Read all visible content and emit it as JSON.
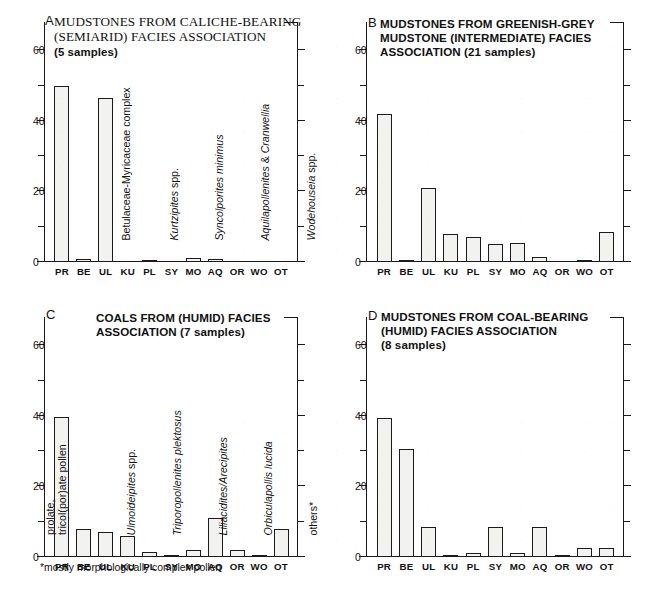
{
  "figure": {
    "categories": [
      "PR",
      "BE",
      "UL",
      "KU",
      "PL",
      "SY",
      "MO",
      "AQ",
      "OR",
      "WO",
      "OT"
    ],
    "y_axis": {
      "ticks_major": [
        0,
        20,
        40,
        60
      ],
      "ticks_minor": [
        10,
        30,
        50
      ],
      "min": 0,
      "max": 68,
      "label_0": "0",
      "label_20": "20",
      "label_40": "40",
      "label_60": "60"
    },
    "footnote": "*mostly morphologically complex pollen"
  },
  "panels": {
    "A": {
      "letter": "A",
      "title": "MUDSTONES FROM CALICHE-BEARING (SEMIARID) FACIES ASSOCIATION",
      "title_line1": "MUDSTONES FROM CALICHE-BEARING",
      "title_line2": "(SEMIARID) FACIES ASSOCIATION",
      "samples": "(5 samples)",
      "species_labels": [
        {
          "text": "Betulaceae-Myricaceae complex",
          "style": "roman",
          "category": "BE"
        },
        {
          "text": "Kurtzipites spp.",
          "style": "italic-genus",
          "category": "KU"
        },
        {
          "text": "Syncolporites minimus",
          "style": "italic",
          "category": "SY"
        },
        {
          "text": "Aquilapollenites & Cranwellia",
          "style": "italic",
          "category": "AQ"
        },
        {
          "text": "Wodehouseia spp.",
          "style": "italic-genus",
          "category": "WO"
        }
      ]
    },
    "B": {
      "letter": "B",
      "title": "MUDSTONES FROM GREENISH-GREY MUDSTONE (INTERMEDIATE) FACIES ASSOCIATION (21 samples)",
      "title_line1": "MUDSTONES FROM GREENISH-GREY",
      "title_line2": "MUDSTONE (INTERMEDIATE) FACIES",
      "title_line3": "ASSOCIATION (21 samples)",
      "samples": "(21 samples)"
    },
    "C": {
      "letter": "C",
      "title": "COALS FROM (HUMID) FACIES ASSOCIATION  (7 samples)",
      "title_line1": "COALS FROM (HUMID) FACIES",
      "title_line2": "ASSOCIATION  (7 samples)",
      "samples": "(7 samples)",
      "species_labels": [
        {
          "text": "prolate,\ntricol(por)ate pollen",
          "style": "roman",
          "category": "PR"
        },
        {
          "text": "Ulmoideipites spp.",
          "style": "italic-genus",
          "category": "UL"
        },
        {
          "text": "Triporopollenites plektosus",
          "style": "italic",
          "category": "PL"
        },
        {
          "text": "Liliacidites/Arecipites",
          "style": "italic",
          "category": "MO"
        },
        {
          "text": "Orbiculapollis lucida",
          "style": "italic",
          "category": "OR"
        },
        {
          "text": "others*",
          "style": "roman",
          "category": "OT"
        }
      ]
    },
    "D": {
      "letter": "D",
      "title": "MUDSTONES FROM COAL-BEARING (HUMID) FACIES ASSOCIATION",
      "title_line1": "MUDSTONES FROM COAL-BEARING",
      "title_line2": "(HUMID) FACIES ASSOCIATION",
      "samples": "(8 samples)"
    }
  },
  "chart_data": [
    {
      "type": "bar",
      "panel": "A",
      "title": "MUDSTONES FROM CALICHE-BEARING (SEMIARID) FACIES ASSOCIATION (5 samples)",
      "categories": [
        "PR",
        "BE",
        "UL",
        "KU",
        "PL",
        "SY",
        "MO",
        "AQ",
        "OR",
        "WO",
        "OT"
      ],
      "values": [
        50,
        0.8,
        46.5,
        0,
        0.4,
        0,
        1.0,
        0.9,
        0,
        0,
        0
      ],
      "xlabel": "",
      "ylabel": "",
      "ylim": [
        0,
        68
      ],
      "grid": false,
      "legend": "none"
    },
    {
      "type": "bar",
      "panel": "B",
      "title": "MUDSTONES FROM GREENISH-GREY MUDSTONE (INTERMEDIATE) FACIES ASSOCIATION (21 samples)",
      "categories": [
        "PR",
        "BE",
        "UL",
        "KU",
        "PL",
        "SY",
        "MO",
        "AQ",
        "OR",
        "WO",
        "OT"
      ],
      "values": [
        42,
        0.6,
        21,
        8,
        7,
        5,
        5.5,
        1.5,
        0,
        0.5,
        8.5
      ],
      "xlabel": "",
      "ylabel": "",
      "ylim": [
        0,
        68
      ],
      "grid": false,
      "legend": "none"
    },
    {
      "type": "bar",
      "panel": "C",
      "title": "COALS FROM (HUMID) FACIES ASSOCIATION (7 samples)",
      "categories": [
        "PR",
        "BE",
        "UL",
        "KU",
        "PL",
        "SY",
        "MO",
        "AQ",
        "OR",
        "WO",
        "OT"
      ],
      "values": [
        39.8,
        8,
        7,
        6,
        1.5,
        0.6,
        2,
        11,
        2,
        0.6,
        8
      ],
      "xlabel": "",
      "ylabel": "",
      "ylim": [
        0,
        68
      ],
      "grid": false,
      "legend": "none"
    },
    {
      "type": "bar",
      "panel": "D",
      "title": "MUDSTONES FROM COAL-BEARING (HUMID) FACIES ASSOCIATION (8 samples)",
      "categories": [
        "PR",
        "BE",
        "UL",
        "KU",
        "PL",
        "SY",
        "MO",
        "AQ",
        "OR",
        "WO",
        "OT"
      ],
      "values": [
        39.5,
        30.5,
        8.5,
        0.6,
        1.1,
        8.5,
        1.1,
        8.5,
        0.4,
        2.6,
        2.6
      ],
      "xlabel": "",
      "ylabel": "",
      "ylim": [
        0,
        68
      ],
      "grid": false,
      "legend": "none"
    }
  ]
}
